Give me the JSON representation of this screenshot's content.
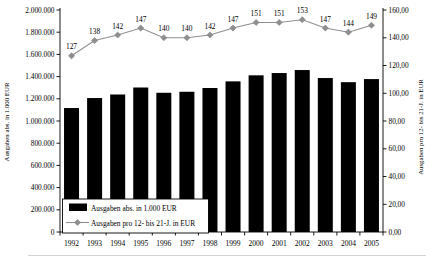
{
  "chart_data": {
    "type": "bar",
    "subtype": "bar-line-combo",
    "categories": [
      "1992",
      "1993",
      "1994",
      "1995",
      "1996",
      "1997",
      "1998",
      "1999",
      "2000",
      "2001",
      "2002",
      "2003",
      "2004",
      "2005"
    ],
    "series": [
      {
        "name": "Ausgaben abs. in 1.000 EUR",
        "type": "bar",
        "axis": "left",
        "color": "#000000",
        "values": [
          1116804,
          1206876,
          1238695,
          1301845,
          1254208,
          1263318,
          1297277,
          1356972,
          1411459,
          1432060,
          1459099,
          1387142,
          1349776,
          1377591
        ],
        "labels": [
          "1.116.804",
          "1.206.876",
          "1.238.695",
          "1.301.845",
          "1.254.208",
          "1.263.318",
          "1.297.277",
          "1.356.972",
          "1.411.459",
          "1.432.060",
          "1.459.099",
          "1.387.142",
          "1.349.776",
          "1.377.591"
        ],
        "label_color": "#ffffff"
      },
      {
        "name": "Ausgaben pro 12- bis 21-J. in EUR",
        "type": "line",
        "axis": "right",
        "color": "#8f8f8f",
        "marker": "diamond",
        "values": [
          127,
          138,
          142,
          147,
          140,
          140,
          142,
          147,
          151,
          151,
          153,
          147,
          144,
          149
        ],
        "labels": [
          "127",
          "138",
          "142",
          "147",
          "140",
          "140",
          "142",
          "147",
          "151",
          "151",
          "153",
          "147",
          "144",
          "149"
        ],
        "label_color": "#000000"
      }
    ],
    "left_axis": {
      "title": "Ausgaben abs. in 1.000 EUR",
      "min": 0,
      "max": 2000000,
      "step": 200000,
      "tick_labels": [
        "2.000.000",
        "1.800.000",
        "1.600.000",
        "1.400.000",
        "1.200.000",
        "1.000.000",
        "800.000",
        "600.000",
        "400.000",
        "200.000",
        "0"
      ]
    },
    "right_axis": {
      "title": "Ausgaben pro 12- bis 21-J. in EUR",
      "min": 0,
      "max": 160,
      "step": 20,
      "tick_labels": [
        "160,00",
        "140,00",
        "120,00",
        "100,00",
        "80,00",
        "60,00",
        "40,00",
        "20,00",
        "0,00"
      ]
    },
    "legend": {
      "position": "inside-bottom-left",
      "entries": [
        {
          "label": "Ausgaben abs. in 1.000 EUR",
          "swatch": "black-bar"
        },
        {
          "label": "Ausgaben pro 12- bis 21-J. in EUR",
          "swatch": "gray-line-diamond"
        }
      ]
    },
    "grid": false,
    "title": "",
    "colors": {
      "bar": "#000000",
      "line": "#8f8f8f",
      "axis": "#000000",
      "bar_label_text": "#ffffff",
      "footer_rule": "#c9c9c9"
    }
  }
}
